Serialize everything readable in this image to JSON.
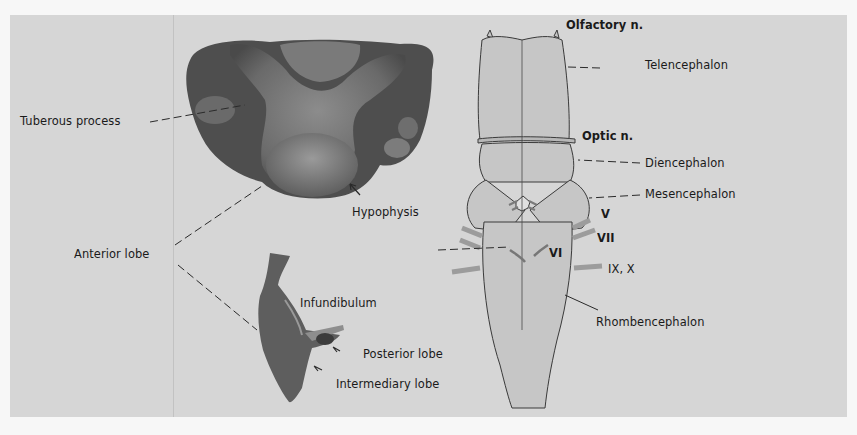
{
  "figure": {
    "left_panel": {
      "specimen_top": "hypophysis-ventral-view",
      "specimen_bottom": "hypophysis-sagittal-section",
      "labels": {
        "tuberous_process": "Tuberous process",
        "hypophysis": "Hypophysis",
        "anterior_lobe": "Anterior lobe",
        "infundibulum": "Infundibulum",
        "posterior_lobe": "Posterior lobe",
        "intermediary_lobe": "Intermediary lobe"
      }
    },
    "right_panel": {
      "drawing": "brain-ventral-view",
      "labels": {
        "olfactory_n": "Olfactory n.",
        "telencephalon": "Telencephalon",
        "optic_n": "Optic n.",
        "diencephalon": "Diencephalon",
        "mesencephalon": "Mesencephalon",
        "nerve_v": "V",
        "nerve_vii": "VII",
        "nerve_vi": "VI",
        "nerve_ix_x": "IX, X",
        "rhombencephalon": "Rhombencephalon"
      }
    },
    "colors": {
      "background": "#d6d6d6",
      "brain_fill": "#c4c4c4",
      "specimen_dark": "#555555",
      "text": "#1a1a1a"
    }
  }
}
